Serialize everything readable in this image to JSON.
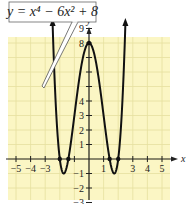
{
  "chart_data": {
    "type": "line",
    "title": "",
    "equation_label": "y = x^4 − 6x^2 + 8",
    "xlabel": "x",
    "ylabel": "y",
    "xlim": [
      -5,
      5
    ],
    "ylim": [
      -3,
      10
    ],
    "grid": true,
    "x_tick_labels": [
      "−5",
      "−4",
      "−3",
      "1",
      "3",
      "4",
      "5"
    ],
    "x_tick_values": [
      -5,
      -4,
      -3,
      1,
      3,
      4,
      5
    ],
    "y_tick_labels": [
      "10",
      "9",
      "8",
      "4",
      "3",
      "2",
      "1",
      "−1",
      "−2",
      "−3"
    ],
    "y_tick_values": [
      10,
      9,
      8,
      4,
      3,
      2,
      1,
      -1,
      -2,
      -3
    ],
    "series": [
      {
        "name": "y = x^4 − 6x^2 + 8",
        "function": "x^4 - 6x^2 + 8",
        "x": [
          -2.5,
          -2.25,
          -2,
          -1.732,
          -1.5,
          -1.414,
          -1,
          -0.5,
          0,
          0.5,
          1,
          1.414,
          1.5,
          1.732,
          2,
          2.25,
          2.5
        ],
        "values": [
          9.56,
          3.26,
          0,
          -1,
          -0.44,
          0,
          3,
          6.56,
          8,
          6.56,
          3,
          0,
          -0.44,
          -1,
          0,
          3.26,
          9.56
        ]
      }
    ],
    "marked_points": [
      {
        "x": -2,
        "y": 0
      },
      {
        "x": -1.414,
        "y": 0
      },
      {
        "x": 1.414,
        "y": 0
      },
      {
        "x": 2,
        "y": 0
      },
      {
        "x": 0,
        "y": 8
      }
    ],
    "colors": {
      "grid_background": "#fbf6c4",
      "grid_lines": "#e6dfa0",
      "curve": "#111111",
      "axis": "#222222"
    }
  },
  "labels": {
    "equation": "y = x⁴ − 6x² + 8",
    "x_axis": "x",
    "y_axis": "y"
  }
}
